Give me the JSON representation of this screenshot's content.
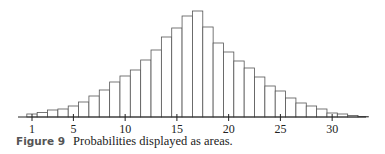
{
  "caption": {
    "figure_label": "Figure 9",
    "text": "Probabilities displayed as areas."
  },
  "chart_data": {
    "type": "bar",
    "title": "",
    "xlabel": "",
    "ylabel": "",
    "grid": false,
    "legend": null,
    "x_ticks": [
      1,
      5,
      10,
      15,
      20,
      25,
      30
    ],
    "xlim": [
      0,
      34
    ],
    "categories": [
      1,
      2,
      3,
      4,
      5,
      6,
      7,
      8,
      9,
      10,
      11,
      12,
      13,
      14,
      15,
      16,
      17,
      18,
      19,
      20,
      21,
      22,
      23,
      24,
      25,
      26,
      27,
      28,
      29,
      30,
      31,
      32,
      33
    ],
    "values": [
      3,
      4.5,
      7,
      8,
      11,
      15,
      21,
      27,
      35,
      41,
      47,
      57,
      67,
      80,
      89,
      101,
      106,
      90,
      74,
      65,
      56,
      49,
      40,
      31,
      26,
      19,
      14,
      11,
      8,
      4,
      3,
      1.5,
      0.5
    ],
    "value_units": "relative bar height (pixels, unlabeled y-axis)",
    "colors": {
      "bar_fill": "#ffffff",
      "bar_stroke": "#555555",
      "axis": "#222222"
    }
  }
}
